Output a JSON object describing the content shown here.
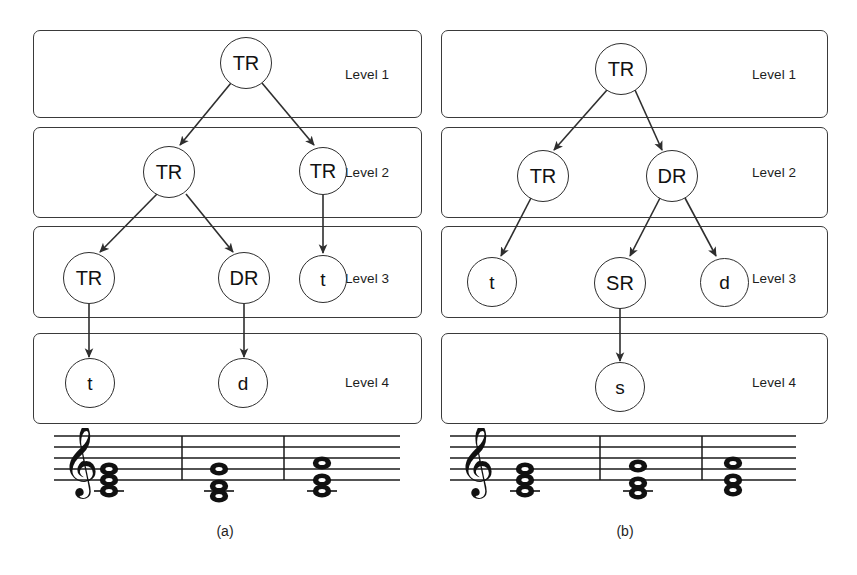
{
  "figure": {
    "caption_a": "(a)",
    "caption_b": "(b)",
    "node_colors": {
      "stroke": "#2e2e2e",
      "box_stroke": "#3a3a3a",
      "text": "#111111"
    }
  },
  "panels": [
    {
      "id": "a",
      "caption": "(a)",
      "levels": [
        {
          "label": "Level 1"
        },
        {
          "label": "Level 2"
        },
        {
          "label": "Level 3"
        },
        {
          "label": "Level 4"
        }
      ],
      "nodes": [
        {
          "id": "a1",
          "label": "TR",
          "level": 1
        },
        {
          "id": "a2l",
          "label": "TR",
          "level": 2
        },
        {
          "id": "a2r",
          "label": "TR",
          "level": 2
        },
        {
          "id": "a3a",
          "label": "TR",
          "level": 3
        },
        {
          "id": "a3b",
          "label": "DR",
          "level": 3
        },
        {
          "id": "a3c",
          "label": "t",
          "level": 3
        },
        {
          "id": "a4a",
          "label": "t",
          "level": 4
        },
        {
          "id": "a4b",
          "label": "d",
          "level": 4
        }
      ],
      "edges": [
        {
          "from": "a1",
          "to": "a2l"
        },
        {
          "from": "a1",
          "to": "a2r"
        },
        {
          "from": "a2l",
          "to": "a3a"
        },
        {
          "from": "a2l",
          "to": "a3b"
        },
        {
          "from": "a2r",
          "to": "a3c"
        },
        {
          "from": "a3a",
          "to": "a4a"
        },
        {
          "from": "a3b",
          "to": "a4b"
        }
      ],
      "score": {
        "clef": "treble-clef",
        "measures": 3,
        "chords": [
          {
            "notes": [
              "c4",
              "e4",
              "g4"
            ]
          },
          {
            "notes": [
              "b3",
              "d4",
              "g4"
            ]
          },
          {
            "notes": [
              "c4",
              "e4",
              "a4"
            ]
          }
        ]
      }
    },
    {
      "id": "b",
      "caption": "(b)",
      "levels": [
        {
          "label": "Level 1"
        },
        {
          "label": "Level 2"
        },
        {
          "label": "Level 3"
        },
        {
          "label": "Level 4"
        }
      ],
      "nodes": [
        {
          "id": "b1",
          "label": "TR",
          "level": 1
        },
        {
          "id": "b2l",
          "label": "TR",
          "level": 2
        },
        {
          "id": "b2r",
          "label": "DR",
          "level": 2
        },
        {
          "id": "b3a",
          "label": "t",
          "level": 3
        },
        {
          "id": "b3b",
          "label": "SR",
          "level": 3
        },
        {
          "id": "b3c",
          "label": "d",
          "level": 3
        },
        {
          "id": "b4a",
          "label": "s",
          "level": 4
        }
      ],
      "edges": [
        {
          "from": "b1",
          "to": "b2l"
        },
        {
          "from": "b1",
          "to": "b2r"
        },
        {
          "from": "b2l",
          "to": "b3a"
        },
        {
          "from": "b2r",
          "to": "b3b"
        },
        {
          "from": "b2r",
          "to": "b3c"
        },
        {
          "from": "b3b",
          "to": "b4a"
        }
      ],
      "score": {
        "clef": "treble-clef",
        "measures": 3,
        "chords": [
          {
            "notes": [
              "c4",
              "e4",
              "g4"
            ]
          },
          {
            "notes": [
              "b3",
              "d4",
              "f4"
            ]
          },
          {
            "notes": [
              "c4",
              "e4",
              "a4"
            ]
          }
        ]
      }
    }
  ]
}
